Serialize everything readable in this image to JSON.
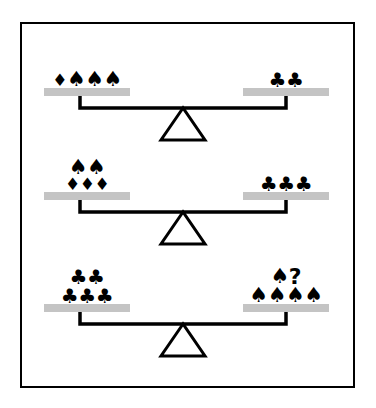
{
  "diagram": {
    "frame_border_color": "#000000",
    "background_color": "#ffffff",
    "pan_color": "#c4c4c4",
    "ink_color": "#000000",
    "symbols": {
      "spade": "♠",
      "club": "♣",
      "diamond": "♦",
      "unknown": "?"
    },
    "balances": [
      {
        "name": "balance-1",
        "state": "balanced",
        "left": {
          "rows": [
            {
              "items": [
                "diamond",
                "spade",
                "spade",
                "spade"
              ]
            }
          ],
          "counts": {
            "diamond": 1,
            "spade": 3,
            "club": 0
          }
        },
        "right": {
          "rows": [
            {
              "items": [
                "club",
                "club"
              ]
            }
          ],
          "counts": {
            "diamond": 0,
            "spade": 0,
            "club": 2
          }
        }
      },
      {
        "name": "balance-2",
        "state": "balanced",
        "left": {
          "rows": [
            {
              "items": [
                "spade",
                "spade"
              ]
            },
            {
              "items": [
                "diamond",
                "diamond",
                "diamond"
              ]
            }
          ],
          "counts": {
            "diamond": 3,
            "spade": 2,
            "club": 0
          }
        },
        "right": {
          "rows": [
            {
              "items": [
                "club",
                "club",
                "club"
              ]
            }
          ],
          "counts": {
            "diamond": 0,
            "spade": 0,
            "club": 3
          }
        }
      },
      {
        "name": "balance-3",
        "state": "balanced",
        "left": {
          "rows": [
            {
              "items": [
                "club",
                "club"
              ]
            },
            {
              "items": [
                "club",
                "club",
                "club"
              ]
            }
          ],
          "counts": {
            "diamond": 0,
            "spade": 0,
            "club": 5
          }
        },
        "right": {
          "rows": [
            {
              "items": [
                "spade",
                "unknown"
              ]
            },
            {
              "items": [
                "spade",
                "spade",
                "spade",
                "spade"
              ]
            }
          ],
          "counts": {
            "diamond": 0,
            "spade": 5,
            "club": 0,
            "unknown": 1
          }
        }
      }
    ]
  }
}
